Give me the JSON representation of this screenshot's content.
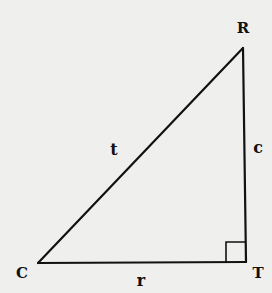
{
  "diagram": {
    "type": "right-triangle",
    "background": "#efefed",
    "stroke_color": "#111111",
    "vertices": [
      {
        "id": "R",
        "label": "R",
        "x": 243,
        "y": 48,
        "label_x": 243,
        "label_y": 33
      },
      {
        "id": "C",
        "label": "C",
        "x": 38,
        "y": 263,
        "label_x": 22,
        "label_y": 278
      },
      {
        "id": "T",
        "label": "T",
        "x": 246,
        "y": 262,
        "label_x": 258,
        "label_y": 278
      }
    ],
    "sides": [
      {
        "id": "t",
        "label": "t",
        "from": "C",
        "to": "R",
        "label_x": 114,
        "label_y": 155
      },
      {
        "id": "c",
        "label": "c",
        "from": "R",
        "to": "T",
        "label_x": 258,
        "label_y": 153
      },
      {
        "id": "r",
        "label": "r",
        "from": "C",
        "to": "T",
        "label_x": 141,
        "label_y": 286
      }
    ],
    "right_angle": {
      "at": "T",
      "size": 20
    }
  }
}
